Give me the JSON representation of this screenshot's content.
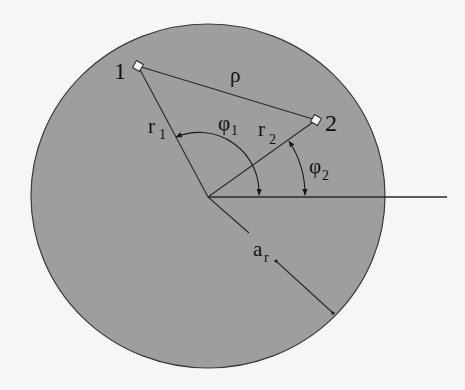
{
  "diagram": {
    "type": "geometry",
    "colors": {
      "background": "#f6f6f6",
      "disk_fill": "#9e9e9e",
      "stroke": "#2a2a2a",
      "point_fill": "#f2f2f2"
    },
    "points": [
      {
        "id": "1",
        "label": "1"
      },
      {
        "id": "2",
        "label": "2"
      }
    ],
    "labels": {
      "point1": "1",
      "point2": "2",
      "distance": "ρ",
      "r1_base": "r",
      "r1_sub": "1",
      "r2_base": "r",
      "r2_sub": "2",
      "phi1_base": "φ",
      "phi1_sub": "1",
      "phi2_base": "φ",
      "phi2_sub": "2",
      "radius_base": "a",
      "radius_sub": "r"
    },
    "edges": [
      {
        "from": "center",
        "to": "1",
        "label": "r1"
      },
      {
        "from": "center",
        "to": "2",
        "label": "r2"
      },
      {
        "from": "1",
        "to": "2",
        "label": "ρ"
      },
      {
        "from": "center",
        "to": "boundary",
        "label": "a_r"
      }
    ],
    "angles": [
      {
        "label": "φ1",
        "from": "reference-axis",
        "to": "r1"
      },
      {
        "label": "φ2",
        "from": "reference-axis",
        "to": "r2"
      }
    ]
  }
}
